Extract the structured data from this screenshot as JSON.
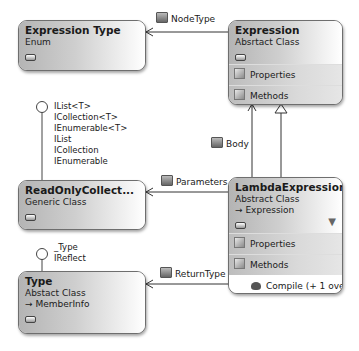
{
  "diagram": {
    "type": "class-diagram",
    "classes": [
      {
        "id": "expression_type",
        "name": "Expression Type",
        "kind": "Enum"
      },
      {
        "id": "expression",
        "name": "Expression",
        "kind": "Absrtact Class",
        "sections": [
          "Properties",
          "Methods"
        ]
      },
      {
        "id": "readonly_collection",
        "name": "ReadOnlyCollect...",
        "kind": "Generic Class",
        "interfaces": [
          "IList<T>",
          "ICollection<T>",
          "IEnumerable<T>",
          "IList",
          "ICollection",
          "IEnumerable"
        ]
      },
      {
        "id": "lambda_expression",
        "name": "LambdaExpression",
        "kind": "Abstract Class",
        "base": "Expression",
        "sections": [
          "Properties",
          "Methods"
        ],
        "members": [
          "Compile (+ 1 ove..."
        ]
      },
      {
        "id": "type",
        "name": "Type",
        "kind": "Abstact Class",
        "base": "MemberInfo",
        "interfaces": [
          "_Type",
          "IReflect"
        ]
      }
    ],
    "associations": [
      {
        "label": "NodeType",
        "from": "expression",
        "to": "expression_type"
      },
      {
        "label": "Body",
        "from": "lambda_expression",
        "to": "expression"
      },
      {
        "label": "Parameters",
        "from": "lambda_expression",
        "to": "readonly_collection"
      },
      {
        "label": "ReturnType",
        "from": "lambda_expression",
        "to": "type"
      }
    ],
    "inheritance": [
      {
        "from": "lambda_expression",
        "to": "expression"
      }
    ]
  },
  "boxes": {
    "expression_type": {
      "name": "Expression Type",
      "kind": "Enum"
    },
    "expression": {
      "name": "Expression",
      "kind": "Absrtact Class",
      "sec1": "Properties",
      "sec2": "Methods"
    },
    "readonly": {
      "name": "ReadOnlyCollect...",
      "kind": "Generic Class",
      "if1": "IList<T>",
      "if2": "ICollection<T>",
      "if3": "IEnumerable<T>",
      "if4": "IList",
      "if5": "ICollection",
      "if6": "IEnumerable"
    },
    "lambda": {
      "name": "LambdaExpression",
      "kind": "Abstract Class",
      "base": "Expression",
      "sec1": "Properties",
      "sec2": "Methods",
      "member1": "Compile (+ 1 ove...",
      "filter_icon": "▼"
    },
    "type": {
      "name": "Type",
      "kind": "Abstact Class",
      "base": "MemberInfo",
      "if1": "_Type",
      "if2": "IReflect"
    }
  },
  "labels": {
    "node_type": "NodeType",
    "body": "Body",
    "parameters": "Parameters",
    "return_type": "ReturnType",
    "inherit_arrow": "→"
  }
}
